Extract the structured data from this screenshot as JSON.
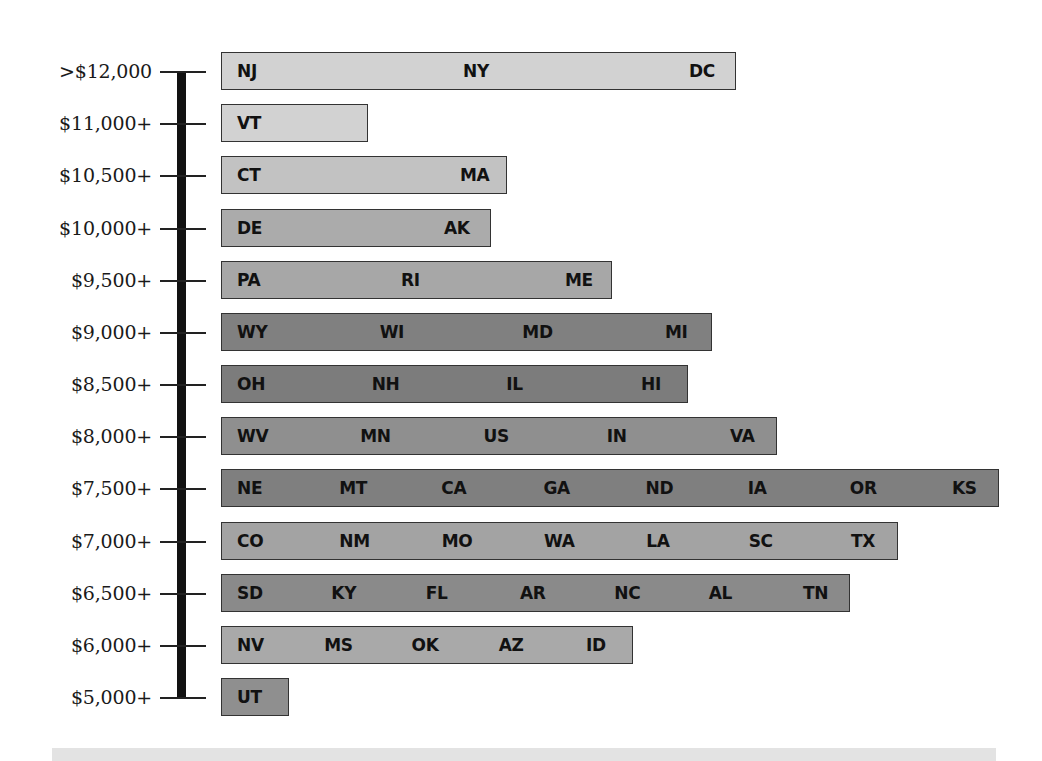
{
  "chart_data": {
    "type": "bar",
    "orientation": "horizontal",
    "title": "",
    "xlabel": "",
    "ylabel": "Per-pupil spending",
    "grid": false,
    "legend": null,
    "categories": [
      ">$12,000",
      "$11,000+",
      "$10,500+",
      "$10,000+",
      "$9,500+",
      "$9,000+",
      "$8,500+",
      "$8,000+",
      "$7,500+",
      "$7,000+",
      "$6,500+",
      "$6,000+",
      "$5,000+"
    ],
    "values": [
      3,
      1,
      2,
      2,
      3,
      4,
      4,
      5,
      8,
      7,
      7,
      5,
      1
    ],
    "value_meaning": "number of states/entries in each spending bracket",
    "groups": [
      {
        "bracket": ">$12,000",
        "states": [
          "NJ",
          "NY",
          "DC"
        ],
        "color": "#d2d2d2",
        "width_px": 515
      },
      {
        "bracket": "$11,000+",
        "states": [
          "VT"
        ],
        "color": "#d2d2d2",
        "width_px": 147
      },
      {
        "bracket": "$10,500+",
        "states": [
          "CT",
          "MA"
        ],
        "color": "#c2c2c2",
        "width_px": 286
      },
      {
        "bracket": "$10,000+",
        "states": [
          "DE",
          "AK"
        ],
        "color": "#ababab",
        "width_px": 270
      },
      {
        "bracket": "$9,500+",
        "states": [
          "PA",
          "RI",
          "ME"
        ],
        "color": "#a7a7a7",
        "width_px": 391
      },
      {
        "bracket": "$9,000+",
        "states": [
          "WY",
          "WI",
          "MD",
          "MI"
        ],
        "color": "#808080",
        "width_px": 491
      },
      {
        "bracket": "$8,500+",
        "states": [
          "OH",
          "NH",
          "IL",
          "HI"
        ],
        "color": "#7c7c7c",
        "width_px": 467
      },
      {
        "bracket": "$8,000+",
        "states": [
          "WV",
          "MN",
          "US",
          "IN",
          "VA"
        ],
        "color": "#8f8f8f",
        "width_px": 556
      },
      {
        "bracket": "$7,500+",
        "states": [
          "NE",
          "MT",
          "CA",
          "GA",
          "ND",
          "IA",
          "OR",
          "KS"
        ],
        "color": "#7f7f7f",
        "width_px": 778
      },
      {
        "bracket": "$7,000+",
        "states": [
          "CO",
          "NM",
          "MO",
          "WA",
          "LA",
          "SC",
          "TX"
        ],
        "color": "#a3a3a3",
        "width_px": 677
      },
      {
        "bracket": "$6,500+",
        "states": [
          "SD",
          "KY",
          "FL",
          "AR",
          "NC",
          "AL",
          "TN"
        ],
        "color": "#8a8a8a",
        "width_px": 629
      },
      {
        "bracket": "$6,000+",
        "states": [
          "NV",
          "MS",
          "OK",
          "AZ",
          "ID"
        ],
        "color": "#a9a9a9",
        "width_px": 412
      },
      {
        "bracket": "$5,000+",
        "states": [
          "UT"
        ],
        "color": "#8f8f8f",
        "width_px": 68
      }
    ]
  }
}
